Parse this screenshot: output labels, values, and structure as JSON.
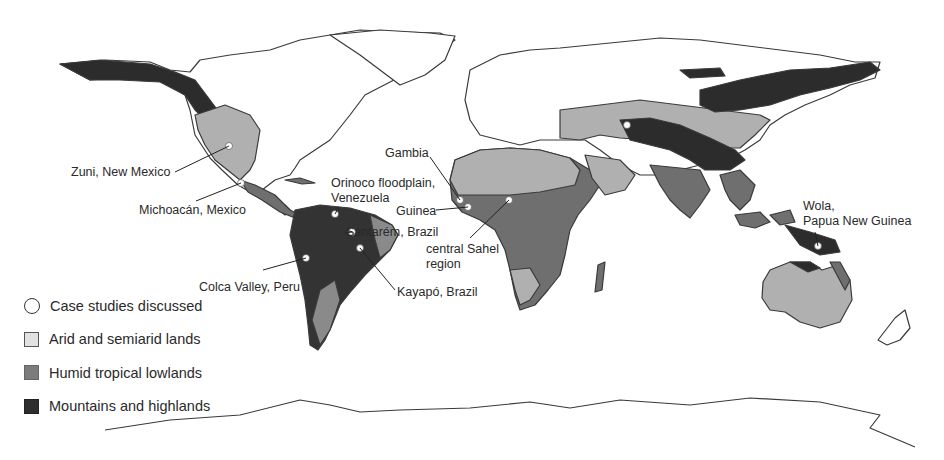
{
  "figure": {
    "type": "world thematic map",
    "colors": {
      "ocean": "#ffffff",
      "unclassified_land": "#ffffff",
      "arid": "#b0b0b0",
      "humid": "#6f6f6f",
      "mountains": "#2c2c2c",
      "outline": "#3a3a3a",
      "marker": "#ffffff"
    }
  },
  "legend": {
    "items": [
      {
        "key": "case",
        "label": "Case studies discussed",
        "symbol": "open-circle"
      },
      {
        "key": "arid",
        "label": "Arid and semiarid lands",
        "symbol": "light-square"
      },
      {
        "key": "humid",
        "label": "Humid tropical lowlands",
        "symbol": "medium-gray-square"
      },
      {
        "key": "mountains",
        "label": "Mountains and highlands",
        "symbol": "dark-square"
      }
    ]
  },
  "case_studies": [
    {
      "name": "Zuni, New Mexico",
      "lines": [
        "Zuni, New Mexico"
      ],
      "marker": [
        229,
        146
      ]
    },
    {
      "name": "Michoacán, Mexico",
      "lines": [
        "Michoacán, Mexico"
      ],
      "marker": [
        241,
        183
      ]
    },
    {
      "name": "Orinoco floodplain, Venezuela",
      "lines": [
        "Orinoco floodplain,",
        "Venezuela"
      ],
      "marker": [
        335,
        214
      ]
    },
    {
      "name": "Santarém, Brazil",
      "lines": [
        "Santarém, Brazil"
      ],
      "marker": [
        352,
        232
      ]
    },
    {
      "name": "Kayapó, Brazil",
      "lines": [
        "Kayapó, Brazil"
      ],
      "marker": [
        360,
        248
      ]
    },
    {
      "name": "Colca Valley, Peru",
      "lines": [
        "Colca Valley, Peru"
      ],
      "marker": [
        306,
        258
      ]
    },
    {
      "name": "Gambia",
      "lines": [
        "Gambia"
      ],
      "marker": [
        460,
        200
      ]
    },
    {
      "name": "Guinea",
      "lines": [
        "Guinea"
      ],
      "marker": [
        468,
        207
      ]
    },
    {
      "name": "central Sahel region",
      "lines": [
        "central Sahel",
        "region"
      ],
      "marker": [
        509,
        200
      ]
    },
    {
      "name": "Wola, Papua New Guinea",
      "lines": [
        "Wola,",
        "Papua New Guinea"
      ],
      "marker": [
        818,
        246
      ]
    }
  ],
  "extra_markers": [
    [
      627,
      125
    ]
  ]
}
